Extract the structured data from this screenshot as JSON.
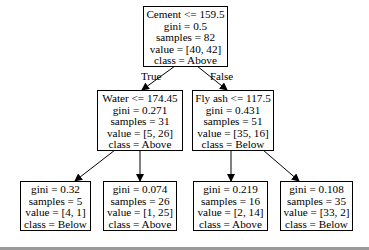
{
  "tree": {
    "root": {
      "lines": [
        "Cement <= 159.5",
        "gini = 0.5",
        "samples = 82",
        "value = [40, 42]",
        "class = Above"
      ]
    },
    "edge_labels": {
      "left": "True",
      "right": "False"
    },
    "left": {
      "lines": [
        "Water <= 174.45",
        "gini = 0.271",
        "samples = 31",
        "value = [5, 26]",
        "class = Above"
      ]
    },
    "right": {
      "lines": [
        "Fly ash <= 117.5",
        "gini = 0.431",
        "samples = 51",
        "value = [35, 16]",
        "class = Below"
      ]
    },
    "left_left": {
      "lines": [
        "gini = 0.32",
        "samples = 5",
        "value = [4, 1]",
        "class = Below"
      ]
    },
    "left_right": {
      "lines": [
        "gini = 0.074",
        "samples = 26",
        "value = [1, 25]",
        "class = Above"
      ]
    },
    "right_left": {
      "lines": [
        "gini = 0.219",
        "samples = 16",
        "value = [2, 14]",
        "class = Above"
      ]
    },
    "right_right": {
      "lines": [
        "gini = 0.108",
        "samples = 35",
        "value = [33, 2]",
        "class = Below"
      ]
    }
  }
}
